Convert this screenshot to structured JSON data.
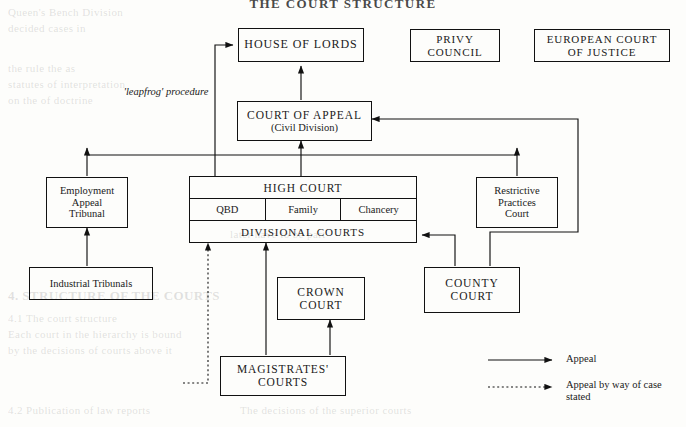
{
  "page": {
    "title": "THE COURT STRUCTURE",
    "leapfrog_label_line1": "'leapfrog'",
    "leapfrog_label_line2": "procedure"
  },
  "boxes": {
    "house_of_lords": {
      "label": "HOUSE OF LORDS"
    },
    "privy_council": {
      "line1": "PRIVY",
      "line2": "COUNCIL"
    },
    "european_court": {
      "line1": "EUROPEAN COURT",
      "line2": "OF JUSTICE"
    },
    "court_of_appeal": {
      "line1": "COURT OF APPEAL",
      "line2": "(Civil Division)"
    },
    "high_court": {
      "title": "HIGH COURT",
      "divisions": [
        "QBD",
        "Family",
        "Chancery"
      ],
      "bottom": "DIVISIONAL COURTS"
    },
    "employment_appeal_tribunal": {
      "line1": "Employment",
      "line2": "Appeal",
      "line3": "Tribunal"
    },
    "industrial_tribunals": {
      "label": "Industrial  Tribunals"
    },
    "restrictive_practices_court": {
      "line1": "Restrictive",
      "line2": "Practices",
      "line3": "Court"
    },
    "crown_court": {
      "line1": "CROWN",
      "line2": "COURT"
    },
    "county_court": {
      "line1": "COUNTY",
      "line2": "COURT"
    },
    "magistrates_courts": {
      "line1": "MAGISTRATES'",
      "line2": "COURTS"
    }
  },
  "legend": {
    "appeal": "Appeal",
    "case_stated_line1": "Appeal by way",
    "case_stated_line2": "of case stated"
  },
  "colors": {
    "ink": "#111111",
    "paper": "#fdfdfb"
  },
  "ghost_text": {
    "g1": "Queen's Bench  Division",
    "g2": "decided cases in",
    "g3": "the  rule  the  as",
    "g4": "statutes  of  interpretation",
    "g5": "on  the  of  doctrine",
    "g6": "later  have  to  be  part",
    "g7": "4.  STRUCTURE OF THE COURTS",
    "g8": "4.1  The  court  structure",
    "g9": "Each court in the hierarchy is bound",
    "g10": "by the decisions of courts above it",
    "g11": "4.2  Publication  of  law  reports",
    "g12": "The decisions of the superior courts"
  }
}
